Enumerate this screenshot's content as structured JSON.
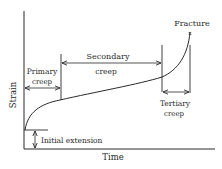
{
  "diagram": {
    "type": "creep-curve",
    "axes": {
      "x_label": "Time",
      "y_label": "Strain"
    },
    "labels": {
      "fracture": "Fracture",
      "fracture_marker": "x",
      "primary_line1": "Primary",
      "primary_line2": "creep",
      "secondary_line1": "Secondary",
      "secondary_line2": "creep",
      "tertiary_line1": "Tertiary",
      "tertiary_line2": "creep",
      "initial_extension": "Initial extension"
    },
    "stages": [
      {
        "name": "Primary creep",
        "description": "decreasing strain rate"
      },
      {
        "name": "Secondary creep",
        "description": "steady-state, roughly constant strain rate"
      },
      {
        "name": "Tertiary creep",
        "description": "accelerating strain rate up to fracture"
      }
    ],
    "colors": {
      "ink": "#2a2a2a",
      "background": "#ffffff"
    }
  }
}
